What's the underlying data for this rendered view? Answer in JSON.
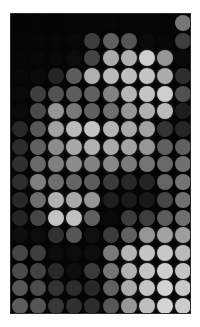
{
  "image": {
    "title": "Halftone dot-matrix grayscale image",
    "background_color": "#ffffff",
    "plot_background_color": "#050505",
    "plot_x": 10,
    "plot_y": 13,
    "plot_width": 181,
    "plot_height": 301,
    "border_color": "#2a2a2a"
  },
  "grid": {
    "columns": 10,
    "rows": 17,
    "cell_width": 18.1,
    "cell_height": 17.7,
    "dot_diameter": 16.0,
    "origin_x": 10,
    "origin_y": 13
  },
  "chart_data": {
    "type": "heatmap",
    "xlabel": "",
    "ylabel": "",
    "colormap": "grayscale",
    "value_range": [
      0,
      255
    ],
    "columns": 10,
    "rows": 17,
    "values": [
      [
        4,
        5,
        5,
        6,
        6,
        7,
        6,
        6,
        5,
        118
      ],
      [
        6,
        7,
        8,
        9,
        60,
        96,
        84,
        10,
        8,
        62
      ],
      [
        7,
        8,
        9,
        12,
        68,
        170,
        176,
        206,
        150,
        10
      ],
      [
        8,
        10,
        36,
        92,
        176,
        186,
        190,
        196,
        172,
        46
      ],
      [
        9,
        62,
        82,
        92,
        96,
        130,
        182,
        196,
        206,
        80
      ],
      [
        10,
        74,
        150,
        120,
        96,
        110,
        150,
        176,
        186,
        30
      ],
      [
        40,
        88,
        162,
        186,
        196,
        180,
        168,
        162,
        52,
        38
      ],
      [
        44,
        96,
        140,
        168,
        176,
        170,
        164,
        150,
        96,
        96
      ],
      [
        48,
        104,
        128,
        140,
        130,
        136,
        122,
        116,
        104,
        112
      ],
      [
        46,
        128,
        110,
        100,
        92,
        58,
        40,
        36,
        100,
        116
      ],
      [
        40,
        110,
        176,
        168,
        150,
        30,
        26,
        24,
        70,
        112
      ],
      [
        36,
        70,
        196,
        192,
        96,
        10,
        60,
        62,
        92,
        110
      ],
      [
        14,
        12,
        48,
        86,
        16,
        58,
        96,
        150,
        162,
        158
      ],
      [
        70,
        62,
        12,
        12,
        14,
        120,
        180,
        196,
        200,
        186
      ],
      [
        74,
        66,
        40,
        14,
        58,
        116,
        176,
        196,
        206,
        196
      ],
      [
        86,
        76,
        50,
        44,
        40,
        96,
        172,
        196,
        210,
        200
      ],
      [
        92,
        84,
        56,
        48,
        44,
        86,
        150,
        190,
        212,
        204
      ]
    ]
  }
}
